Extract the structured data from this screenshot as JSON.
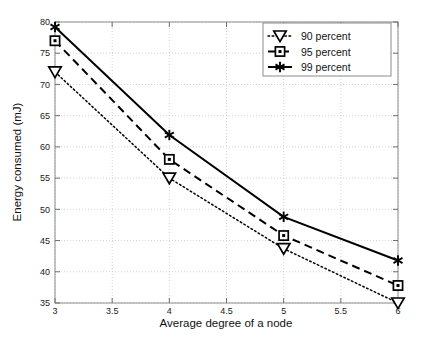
{
  "chart_data": {
    "type": "line",
    "title": "",
    "xlabel": "Average degree of a node",
    "ylabel": "Energy consumed (mJ)",
    "xlim": [
      3,
      6
    ],
    "ylim": [
      35,
      80
    ],
    "xticks": [
      "3",
      "3.5",
      "4",
      "4.5",
      "5",
      "5.5",
      "6"
    ],
    "xtick_values": [
      3,
      3.5,
      4,
      4.5,
      5,
      5.5,
      6
    ],
    "yticks": [
      "35",
      "40",
      "45",
      "50",
      "55",
      "60",
      "65",
      "70",
      "75",
      "80"
    ],
    "ytick_values": [
      35,
      40,
      45,
      50,
      55,
      60,
      65,
      70,
      75,
      80
    ],
    "grid": true,
    "legend_position": "top-right",
    "x": [
      3,
      4,
      5,
      6
    ],
    "series": [
      {
        "name": "90 percent",
        "label": "90 percent",
        "values": [
          72.0,
          55.0,
          43.7,
          35.0
        ],
        "marker": "triangle-down",
        "linestyle": "dotted",
        "color": "#000000"
      },
      {
        "name": "95 percent",
        "label": "95 percent",
        "values": [
          77.0,
          58.0,
          45.8,
          37.8
        ],
        "marker": "square",
        "linestyle": "dashed",
        "color": "#000000"
      },
      {
        "name": "99 percent",
        "label": "99 percent",
        "values": [
          79.2,
          61.9,
          48.8,
          41.8
        ],
        "marker": "asterisk",
        "linestyle": "solid",
        "color": "#000000"
      }
    ]
  },
  "axes": {
    "x_label": "Average degree of a node",
    "y_label": "Energy consumed (mJ)"
  },
  "legend": {
    "items": [
      {
        "label": "90 percent"
      },
      {
        "label": "95 percent"
      },
      {
        "label": "99 percent"
      }
    ]
  },
  "colors": {
    "line": "#000000",
    "grid": "#c8c8c8",
    "axis": "#7d7d7d",
    "background": "#ffffff"
  }
}
